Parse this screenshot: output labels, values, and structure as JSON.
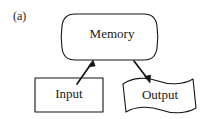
{
  "figure": {
    "panel_label": "(a)",
    "background_color": "#ffffff",
    "ink_color": "#141414",
    "nodes": [
      {
        "id": "memory",
        "label": "Memory",
        "shape": "rounded-barrel",
        "x": 63,
        "y": 14,
        "width": 93,
        "height": 46,
        "label_x": 112,
        "label_y": 35
      },
      {
        "id": "input",
        "label": "Input",
        "shape": "rectangle",
        "x": 35,
        "y": 78,
        "width": 68,
        "height": 34,
        "label_x": 69,
        "label_y": 95
      },
      {
        "id": "output",
        "label": "Output",
        "shape": "wave-document",
        "x": 122,
        "y": 79,
        "width": 76,
        "height": 34,
        "label_x": 161,
        "label_y": 96
      }
    ],
    "connectors": [
      {
        "id": "input-to-memory",
        "from": "input",
        "to": "memory",
        "x1": 78,
        "y1": 83,
        "x2": 93,
        "y2": 61,
        "direction": "up-right",
        "arrowhead": "end"
      },
      {
        "id": "memory-to-output",
        "from": "memory",
        "to": "output",
        "x1": 134,
        "y1": 60,
        "x2": 150,
        "y2": 82,
        "direction": "down-right",
        "arrowhead": "end"
      }
    ]
  }
}
